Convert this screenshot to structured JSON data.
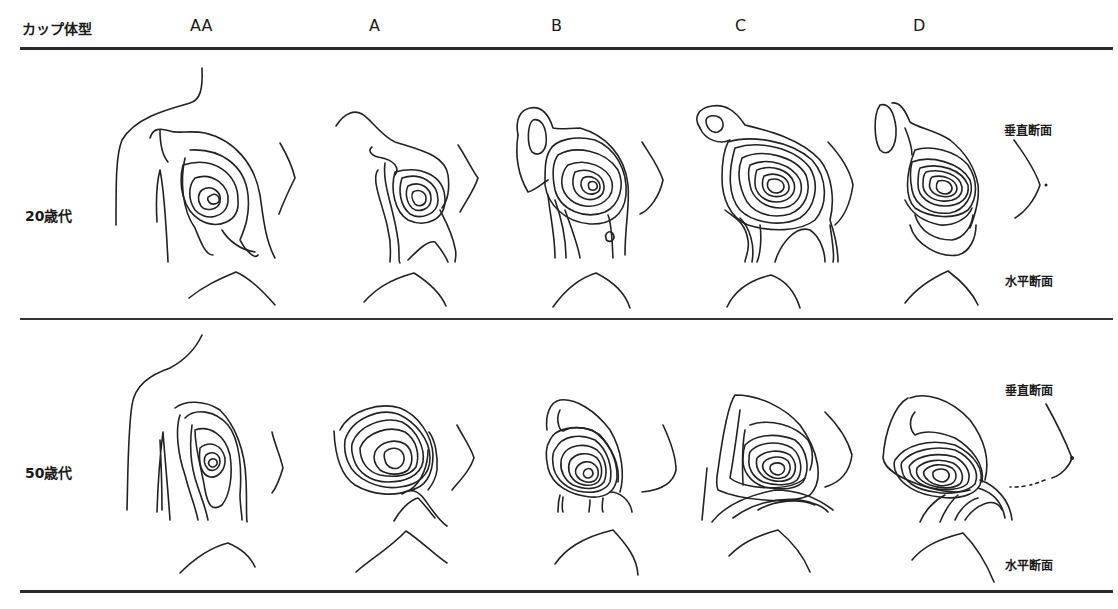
{
  "header": {
    "row_label": "カップ体型",
    "columns": [
      "AA",
      "A",
      "B",
      "C",
      "D"
    ]
  },
  "rows": [
    {
      "label": "20歳代",
      "vertical_section": "垂直断面",
      "horizontal_section": "水平断面"
    },
    {
      "label": "50歳代",
      "vertical_section": "垂直断面",
      "horizontal_section": "水平断面"
    }
  ],
  "figure": {
    "type": "moire-contour-comparison",
    "panels": [
      {
        "row": "20歳代",
        "cup": "AA"
      },
      {
        "row": "20歳代",
        "cup": "A"
      },
      {
        "row": "20歳代",
        "cup": "B"
      },
      {
        "row": "20歳代",
        "cup": "C"
      },
      {
        "row": "20歳代",
        "cup": "D"
      },
      {
        "row": "50歳代",
        "cup": "AA"
      },
      {
        "row": "50歳代",
        "cup": "A"
      },
      {
        "row": "50歳代",
        "cup": "B"
      },
      {
        "row": "50歳代",
        "cup": "C"
      },
      {
        "row": "50歳代",
        "cup": "D"
      }
    ]
  }
}
